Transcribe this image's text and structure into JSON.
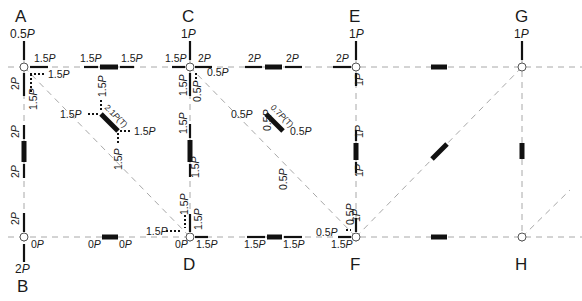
{
  "diagram": {
    "type": "truss free-body diagram",
    "nodes": [
      {
        "id": "A",
        "label": "A",
        "load": "0.5P",
        "x": 24,
        "y": 67
      },
      {
        "id": "B",
        "label": "B",
        "reaction": "2P",
        "x": 24,
        "y": 237
      },
      {
        "id": "C",
        "label": "C",
        "load": "1P",
        "x": 190,
        "y": 67
      },
      {
        "id": "D",
        "label": "D",
        "x": 190,
        "y": 237
      },
      {
        "id": "E",
        "label": "E",
        "load": "1P",
        "x": 356,
        "y": 67
      },
      {
        "id": "F",
        "label": "F",
        "x": 356,
        "y": 237
      },
      {
        "id": "G",
        "label": "G",
        "load": "1P",
        "x": 522,
        "y": 67
      },
      {
        "id": "H",
        "label": "H",
        "x": 522,
        "y": 237
      }
    ],
    "node_A": {
      "label": "A",
      "load": "0.5P",
      "top_member_force": "1.5P",
      "diag_component_h": "1.5P",
      "vertical_member_force": "2P",
      "diag_component_v": "1.5P"
    },
    "member_AC": {
      "left": "1.5P",
      "right": "1.5P"
    },
    "member_AB": {
      "top": "2P",
      "bottom": "2P"
    },
    "diagonal_AD": {
      "label": "2.1P(T)",
      "component_top": "1.5P",
      "component_left": "1.5P",
      "component_right": "1.5P",
      "component_bottom": "1.5P"
    },
    "node_B": {
      "label": "B",
      "reaction": "2P",
      "vertical_member_force": "2P",
      "horizontal_member_force": "0P"
    },
    "member_BD": {
      "left": "0P",
      "right": "0P"
    },
    "node_C": {
      "label": "C",
      "load": "1P",
      "left_force": "1.5P",
      "right_force": "2P",
      "diag_component_h": "0.5P",
      "vertical_member_force": "1.5P",
      "diag_component_v": "0.5P"
    },
    "member_CE": {
      "left": "2P",
      "right": "2P"
    },
    "member_CD": {
      "top": "1.5P",
      "bottom": "1.5P"
    },
    "diagonal_CF": {
      "label": "0.7P(T)",
      "component_top": "0.5P",
      "component_left": "0.5P",
      "component_right": "0.5P",
      "component_bottom": "0.5P"
    },
    "node_D": {
      "label": "D",
      "diag_component_h": "1.5P",
      "diag_component_v": "1.5P",
      "vertical_member_force": "1.5P",
      "left_force": "0P",
      "right_force": "1.5P"
    },
    "member_DF": {
      "left": "1.5P",
      "right": "1.5P"
    },
    "node_E": {
      "label": "E",
      "load": "1P",
      "left_force": "2P",
      "vertical_member_force": "1P"
    },
    "member_EF": {
      "top": "1P",
      "bottom": "1P"
    },
    "node_F": {
      "label": "F",
      "diag_component_h": "0.5P",
      "diag_component_v": "0.5P",
      "vertical_member_force": "1P",
      "left_force": "1.5P"
    },
    "node_G": {
      "label": "G",
      "load": "1P"
    },
    "node_H": {
      "label": "H"
    }
  }
}
